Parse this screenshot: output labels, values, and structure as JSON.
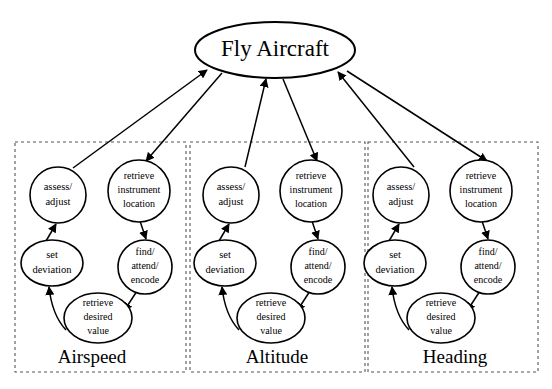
{
  "diagram": {
    "title": "Fly Aircraft",
    "type": "hierarchical-task-analysis",
    "root": {
      "id": "fly-aircraft",
      "label": "Fly Aircraft"
    },
    "groups": [
      {
        "id": "airspeed",
        "label": "Airspeed",
        "nodes": {
          "assess_adjust": {
            "line1": "assess/",
            "line2": "adjust"
          },
          "retrieve_instrument_location": {
            "line1": "retrieve",
            "line2": "instrument",
            "line3": "location"
          },
          "set_deviation": {
            "line1": "set",
            "line2": "deviation"
          },
          "find_attend_encode": {
            "line1": "find/",
            "line2": "attend/",
            "line3": "encode"
          },
          "retrieve_desired_value": {
            "line1": "retrieve",
            "line2": "desired",
            "line3": "value"
          }
        }
      },
      {
        "id": "altitude",
        "label": "Altitude",
        "nodes": {
          "assess_adjust": {
            "line1": "assess/",
            "line2": "adjust"
          },
          "retrieve_instrument_location": {
            "line1": "retrieve",
            "line2": "instrument",
            "line3": "location"
          },
          "set_deviation": {
            "line1": "set",
            "line2": "deviation"
          },
          "find_attend_encode": {
            "line1": "find/",
            "line2": "attend/",
            "line3": "encode"
          },
          "retrieve_desired_value": {
            "line1": "retrieve",
            "line2": "desired",
            "line3": "value"
          }
        }
      },
      {
        "id": "heading",
        "label": "Heading",
        "nodes": {
          "assess_adjust": {
            "line1": "assess/",
            "line2": "adjust"
          },
          "retrieve_instrument_location": {
            "line1": "retrieve",
            "line2": "instrument",
            "line3": "location"
          },
          "set_deviation": {
            "line1": "set",
            "line2": "deviation"
          },
          "find_attend_encode": {
            "line1": "find/",
            "line2": "attend/",
            "line3": "encode"
          },
          "retrieve_desired_value": {
            "line1": "retrieve",
            "line2": "desired",
            "line3": "value"
          }
        }
      }
    ],
    "edges": [
      {
        "from": "assess_adjust",
        "to": "fly-aircraft",
        "direction": "up"
      },
      {
        "from": "fly-aircraft",
        "to": "retrieve_instrument_location",
        "direction": "down"
      },
      {
        "from": "set_deviation",
        "to": "assess_adjust",
        "direction": "up"
      },
      {
        "from": "retrieve_instrument_location",
        "to": "find_attend_encode",
        "direction": "down"
      },
      {
        "from": "find_attend_encode",
        "to": "retrieve_desired_value",
        "direction": "down"
      },
      {
        "from": "retrieve_desired_value",
        "to": "set_deviation",
        "direction": "up"
      }
    ],
    "colors": {
      "stroke": "#000000",
      "fill": "#ffffff",
      "box_stroke": "#555555",
      "background": "#ffffff"
    }
  }
}
